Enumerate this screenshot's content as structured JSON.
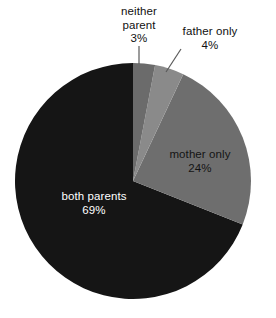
{
  "chart_data": {
    "type": "pie",
    "title": "",
    "subtitle": "",
    "xlabel": "",
    "ylabel": "",
    "legend": "none",
    "grid": false,
    "units": "percent",
    "total": 100,
    "start_angle_deg": 0,
    "direction": "clockwise",
    "categories": [
      "neither parent",
      "father only",
      "mother only",
      "both parents"
    ],
    "values": [
      3,
      4,
      24,
      69
    ],
    "slices": [
      {
        "name": "neither parent",
        "label": "neither parent",
        "label_line1": "neither",
        "label_line2": "parent",
        "value": 3,
        "value_label": "3%",
        "color": "#6b6b6b",
        "label_position": "outside",
        "label_text_color": "#111111",
        "leader_line": true
      },
      {
        "name": "father only",
        "label": "father only",
        "label_line1": "father only",
        "label_line2": "",
        "value": 4,
        "value_label": "4%",
        "color": "#8a8a8a",
        "label_position": "outside",
        "label_text_color": "#111111",
        "leader_line": true
      },
      {
        "name": "mother only",
        "label": "mother only",
        "label_line1": "mother only",
        "label_line2": "",
        "value": 24,
        "value_label": "24%",
        "color": "#6e6e6e",
        "label_position": "inside",
        "label_text_color": "#141414",
        "leader_line": false
      },
      {
        "name": "both parents",
        "label": "both parents",
        "label_line1": "both parents",
        "label_line2": "",
        "value": 69,
        "value_label": "69%",
        "color": "#151515",
        "label_position": "inside",
        "label_text_color": "#ffffff",
        "leader_line": false
      }
    ]
  },
  "colors": {
    "background": "#ffffff",
    "both_parents": "#151515",
    "mother_only": "#6e6e6e",
    "father_only": "#8a8a8a",
    "neither_parent": "#6b6b6b",
    "leader_line": "#5a5a5a",
    "label_dark": "#111111",
    "label_light": "#ffffff"
  }
}
